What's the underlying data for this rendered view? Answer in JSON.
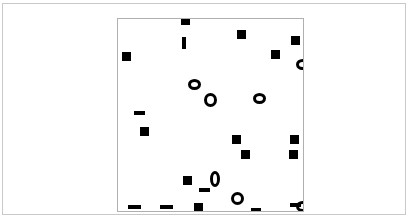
{
  "figure": {
    "background_color": "#ffffff",
    "frame_color": "#c9c9c9",
    "axes_border_color": "#b0b0b0",
    "marker_color": "#000000",
    "title": "",
    "xlabel": "",
    "ylabel": "",
    "caption": ""
  },
  "chart_data": {
    "type": "scatter",
    "title": "",
    "subtitle": "",
    "xlabel": "",
    "ylabel": "",
    "legend": [],
    "legend_position": "none",
    "grid": false,
    "xticklabels": [],
    "yticklabels": [],
    "xlim": [
      0,
      187
    ],
    "ylim": [
      0,
      194
    ],
    "axis_units": "pixels-relative-to-plot-box",
    "marker_color": "#000000",
    "note": "Pixel coordinates x,y are measured from the top-left inside corner of the plot box; w,h are marker width and height in pixels.",
    "series": [
      {
        "name": "filled-square",
        "marker": "square",
        "count": 15,
        "points": [
          {
            "x": 63,
            "y": -3,
            "w": 9,
            "h": 9
          },
          {
            "x": 119,
            "y": 11,
            "w": 9,
            "h": 9
          },
          {
            "x": 173,
            "y": 17,
            "w": 9,
            "h": 9
          },
          {
            "x": 4,
            "y": 33,
            "w": 9,
            "h": 9
          },
          {
            "x": 153,
            "y": 31,
            "w": 9,
            "h": 9
          },
          {
            "x": 22,
            "y": 108,
            "w": 9,
            "h": 9
          },
          {
            "x": 114,
            "y": 116,
            "w": 9,
            "h": 9
          },
          {
            "x": 172,
            "y": 116,
            "w": 9,
            "h": 9
          },
          {
            "x": 123,
            "y": 131,
            "w": 9,
            "h": 9
          },
          {
            "x": 171,
            "y": 131,
            "w": 9,
            "h": 9
          },
          {
            "x": 65,
            "y": 157,
            "w": 9,
            "h": 9
          },
          {
            "x": 76,
            "y": 184,
            "w": 9,
            "h": 9
          }
        ]
      },
      {
        "name": "horizontal-dash",
        "marker": "hbar",
        "count": 7,
        "points": [
          {
            "x": 16,
            "y": 92,
            "w": 11,
            "h": 4
          },
          {
            "x": 81,
            "y": 169,
            "w": 11,
            "h": 4
          },
          {
            "x": 10,
            "y": 186,
            "w": 13,
            "h": 4
          },
          {
            "x": 42,
            "y": 186,
            "w": 13,
            "h": 4
          },
          {
            "x": 133,
            "y": 189,
            "w": 10,
            "h": 4
          },
          {
            "x": 172,
            "y": 184,
            "w": 11,
            "h": 4
          }
        ]
      },
      {
        "name": "vertical-dash",
        "marker": "vbar",
        "count": 1,
        "points": [
          {
            "x": 64,
            "y": 18,
            "w": 4,
            "h": 12
          }
        ]
      },
      {
        "name": "open-ring",
        "marker": "ring",
        "count": 6,
        "points": [
          {
            "x": 70,
            "y": 60,
            "w": 13,
            "h": 11
          },
          {
            "x": 86,
            "y": 74,
            "w": 13,
            "h": 14
          },
          {
            "x": 135,
            "y": 74,
            "w": 13,
            "h": 11
          },
          {
            "x": 92,
            "y": 152,
            "w": 10,
            "h": 16
          },
          {
            "x": 113,
            "y": 173,
            "w": 13,
            "h": 13
          },
          {
            "x": 178,
            "y": 40,
            "w": 13,
            "h": 11
          }
        ]
      },
      {
        "name": "clipped-edge-marker",
        "marker": "ring-clipped",
        "count": 1,
        "points": [
          {
            "x": 178,
            "y": 182,
            "w": 13,
            "h": 11
          }
        ]
      }
    ]
  }
}
